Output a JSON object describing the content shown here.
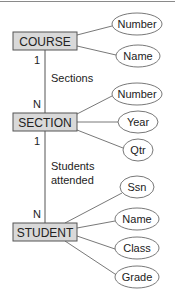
{
  "diagram": {
    "type": "er-diagram",
    "colors": {
      "entity_fill": "#d9d9d9",
      "entity_stroke": "#555555",
      "line": "#555555",
      "attribute_fill": "#ffffff",
      "attribute_stroke": "#555555",
      "text": "#222222"
    },
    "entities": [
      {
        "name": "COURSE",
        "attributes": [
          "Number",
          "Name"
        ]
      },
      {
        "name": "SECTION",
        "attributes": [
          "Number",
          "Year",
          "Qtr"
        ]
      },
      {
        "name": "STUDENT",
        "attributes": [
          "Ssn",
          "Name",
          "Class",
          "Grade"
        ]
      }
    ],
    "relationships": [
      {
        "label": "Sections",
        "from": "COURSE",
        "to": "SECTION",
        "from_cardinality": "1",
        "to_cardinality": "N"
      },
      {
        "label_line1": "Students",
        "label_line2": "attended",
        "from": "SECTION",
        "to": "STUDENT",
        "from_cardinality": "1",
        "to_cardinality": "N"
      }
    ]
  }
}
